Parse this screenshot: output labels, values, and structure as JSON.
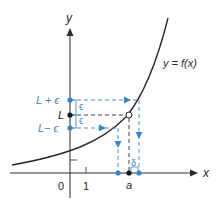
{
  "figure": {
    "axis_labels": {
      "x": "x",
      "y": "y"
    },
    "tick_labels": {
      "origin": "0",
      "one": "1"
    },
    "curve_label": "y = f(x)",
    "y_markers": {
      "upper": "L + ϵ",
      "center": "L",
      "lower": "L− ϵ"
    },
    "epsilon_label": "ϵ",
    "delta_label": "δ",
    "x_marker": "a",
    "colors": {
      "axis": "#2a2a2a",
      "curve": "#2a2a2a",
      "accent": "#3a86c8",
      "dashed_black": "#2a2a2a"
    }
  }
}
